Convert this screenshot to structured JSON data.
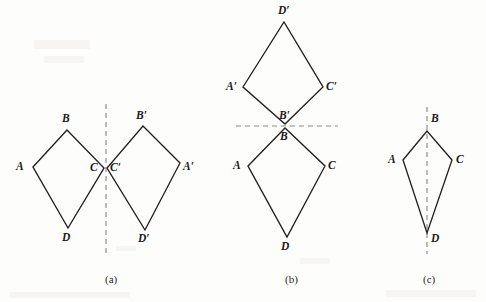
{
  "figure": {
    "width": 486,
    "height": 302,
    "background_color": "#fdfdfb",
    "stroke_color": "#231f20",
    "mirror_color": "#8f8c8a"
  },
  "panels": [
    {
      "id": "a",
      "caption": "(a)",
      "caption_pos": {
        "x": 105,
        "y": 274
      },
      "mirror": {
        "orientation": "vertical",
        "x1": 106,
        "y1": 104,
        "x2": 106,
        "y2": 256
      },
      "shapes": [
        {
          "name": "kite-abcd",
          "points": "33,167 67,130 104,168 68,228",
          "vertices": [
            {
              "label": "A",
              "x": 33,
              "y": 167,
              "lx": 16,
              "ly": 161
            },
            {
              "label": "B",
              "x": 67,
              "y": 130,
              "lx": 62,
              "ly": 113
            },
            {
              "label": "C",
              "x": 104,
              "y": 168,
              "lx": 90,
              "ly": 162
            },
            {
              "label": "D",
              "x": 68,
              "y": 228,
              "lx": 62,
              "ly": 232
            }
          ]
        },
        {
          "name": "kite-abcd-prime",
          "points": "180,163 143,126 107,168 145,230",
          "vertices": [
            {
              "label": "A′",
              "x": 180,
              "y": 163,
              "lx": 183,
              "ly": 161
            },
            {
              "label": "B′",
              "x": 143,
              "y": 126,
              "lx": 136,
              "ly": 110
            },
            {
              "label": "C′",
              "x": 107,
              "y": 168,
              "lx": 110,
              "ly": 162
            },
            {
              "label": "D′",
              "x": 145,
              "y": 230,
              "lx": 138,
              "ly": 233
            }
          ]
        }
      ]
    },
    {
      "id": "b",
      "caption": "(b)",
      "caption_pos": {
        "x": 285,
        "y": 274
      },
      "mirror": {
        "orientation": "horizontal",
        "x1": 236,
        "y1": 126,
        "x2": 338,
        "y2": 126
      },
      "shapes": [
        {
          "name": "kite-abcd-prime",
          "points": "243,87 284,22 323,87 285,124",
          "vertices": [
            {
              "label": "A′",
              "x": 243,
              "y": 87,
              "lx": 226,
              "ly": 81
            },
            {
              "label": "D′",
              "x": 284,
              "y": 22,
              "lx": 278,
              "ly": 5
            },
            {
              "label": "C′",
              "x": 323,
              "y": 87,
              "lx": 326,
              "ly": 81
            },
            {
              "label": "B′",
              "x": 285,
              "y": 124,
              "lx": 279,
              "ly": 110
            }
          ]
        },
        {
          "name": "kite-abcd",
          "points": "248,166 285,128 325,166 287,237",
          "vertices": [
            {
              "label": "A",
              "x": 248,
              "y": 166,
              "lx": 233,
              "ly": 160
            },
            {
              "label": "B",
              "x": 285,
              "y": 128,
              "lx": 280,
              "ly": 131
            },
            {
              "label": "C",
              "x": 325,
              "y": 166,
              "lx": 328,
              "ly": 160
            },
            {
              "label": "D",
              "x": 287,
              "y": 237,
              "lx": 281,
              "ly": 241
            }
          ]
        }
      ]
    },
    {
      "id": "c",
      "caption": "(c)",
      "caption_pos": {
        "x": 423,
        "y": 274
      },
      "mirror": {
        "orientation": "vertical",
        "x1": 427,
        "y1": 107,
        "x2": 427,
        "y2": 254
      },
      "shapes": [
        {
          "name": "kite-abcd",
          "points": "403,160 427,131 452,160 427,233",
          "vertices": [
            {
              "label": "A",
              "x": 403,
              "y": 160,
              "lx": 388,
              "ly": 154
            },
            {
              "label": "B",
              "x": 427,
              "y": 131,
              "lx": 431,
              "ly": 113
            },
            {
              "label": "C",
              "x": 452,
              "y": 160,
              "lx": 456,
              "ly": 154
            },
            {
              "label": "D",
              "x": 427,
              "y": 233,
              "lx": 431,
              "ly": 233
            }
          ]
        }
      ]
    }
  ]
}
